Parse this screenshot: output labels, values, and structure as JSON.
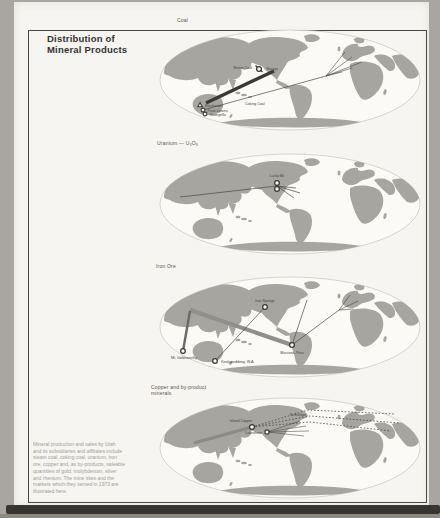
{
  "page_title": {
    "line1": "Distribution of",
    "line2": "Mineral Products"
  },
  "description": {
    "lines": [
      "Mineral production and sales by Utah",
      "and its subsidiaries and affiliates include",
      "steam coal, coking coal, uranium, iron",
      "ore, copper and, as by-products, saleable",
      "quantities of gold, molybdenum, silver",
      "and rhenium. The mine sites and the",
      "markets which they served in 1973 are",
      "illustrated here."
    ]
  },
  "maps": {
    "coal": {
      "caption": "Coal",
      "labels": {
        "mine_1": "Blackwater",
        "mine_2": "Peak Downs",
        "mine_3": "Goonyella",
        "route_note": "Coking Coal",
        "us_left": "Steam Coal",
        "us_right": "Navajo"
      }
    },
    "uranium": {
      "caption": "Uranium — U₃O₈",
      "labels": {
        "mine": "Lucky Mc"
      }
    },
    "iron_ore": {
      "caption": "Iron Ore",
      "labels": {
        "us_mine": "Iron Springs",
        "peru_mine": "Marcona, Peru",
        "australia_mine_1": "Mt. Goldsworthy",
        "australia_mine_2": "Koolyanobbing, W.A."
      }
    },
    "copper": {
      "caption_line1": "Copper and by-product",
      "caption_line2": "minerals",
      "labels": {
        "bc_mine": "Island Copper",
        "us_mine": "Lakeshore",
        "route_note": "To Europe"
      }
    }
  },
  "colors": {
    "land": "#a6a5a0",
    "ocean": "#fbfaf6",
    "route_dark": "#4a4944",
    "route_light": "#908f8b",
    "page": "#f6f5f1"
  }
}
